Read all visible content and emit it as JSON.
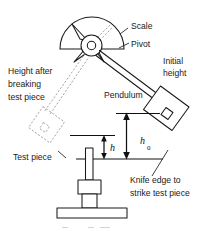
{
  "diagram": {
    "background_color": "#ffffff",
    "ink_color": "#1a1a1a",
    "ghost_color": "#9a9a9a",
    "width": 215,
    "height": 230,
    "labels": {
      "scale": "Scale",
      "pivot": "Pivot",
      "pendulum": "Pendulum",
      "initial_height_line1": "Initial",
      "initial_height_line2": "height",
      "height_after_line1": "Height after",
      "height_after_line2": "breaking",
      "height_after_line3": "test piece",
      "test_piece": "Test piece",
      "knife_edge_line1": "Knife edge to",
      "knife_edge_line2": "strike test piece",
      "h_zero_symbol": "h",
      "h_zero_subscript": "0",
      "h_symbol": "h"
    },
    "parts": {
      "scale_dial": "semicircular-scale-dial",
      "pivot_hub": "pivot-hub-ring",
      "pointer": "scale-pointer",
      "pendulum_arm": "pendulum-arm",
      "hammer_initial": "pendulum-hammer-raised",
      "hammer_after": "pendulum-hammer-after-break-ghost",
      "specimen": "test-piece-specimen",
      "anvil": "anvil-support",
      "base": "machine-base"
    }
  }
}
